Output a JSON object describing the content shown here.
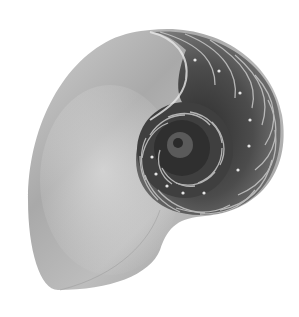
{
  "image": {
    "subject": "Nautilus shell cross-section",
    "alt": "Grayscale photograph of a halved nautilus shell showing its logarithmic spiral chambers",
    "background": "#ffffff",
    "colors": {
      "shell_light": "#e2e2e2",
      "shell_mid": "#b0b0b0",
      "shell_shadow": "#8a8a8a",
      "chamber_dark": "#3c3c3c",
      "septa": "#c8c8c8"
    }
  }
}
